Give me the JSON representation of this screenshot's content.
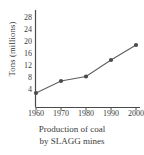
{
  "chart_data": {
    "type": "line",
    "title": "",
    "caption_line1": "Production of coal",
    "caption_line2": "by SLAGG mines",
    "xlabel": "",
    "ylabel": "Tons (millions)",
    "x": [
      1960,
      1970,
      1980,
      1990,
      2000
    ],
    "categories": [
      "1960",
      "1970",
      "1980",
      "1990",
      "2000"
    ],
    "values": [
      3,
      7,
      8.5,
      14,
      19
    ],
    "series": [
      {
        "name": "Production of coal by SLAGG mines",
        "values": [
          3,
          7,
          8.5,
          14,
          19
        ]
      }
    ],
    "xtick_labels": [
      "1960",
      "1970",
      "1980",
      "1990",
      "2000"
    ],
    "ytick_labels": [
      "4",
      "8",
      "12",
      "16",
      "20",
      "24",
      "28"
    ],
    "ytick_values": [
      4,
      8,
      12,
      16,
      20,
      24,
      28
    ],
    "xlim": [
      1955,
      2005
    ],
    "ylim": [
      0,
      30
    ],
    "grid": false,
    "legend": false,
    "legend_position": "none",
    "line_color": "#5f5f5f",
    "marker_color": "#4a4a4a",
    "marker": "circle",
    "axis_color": "#4a4a4a",
    "background_color": "#ffffff"
  }
}
